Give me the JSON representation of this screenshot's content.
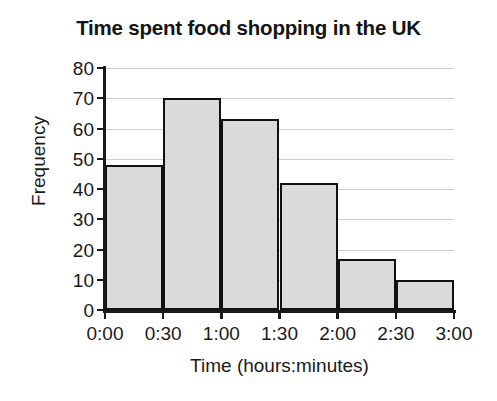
{
  "chart_data": {
    "type": "bar",
    "title": "Time spent food shopping in the UK",
    "xlabel": "Time (hours:minutes)",
    "ylabel": "Frequency",
    "categories": [
      "0:00-0:30",
      "0:30-1:00",
      "1:00-1:30",
      "1:30-2:00",
      "2:00-2:30",
      "2:30-3:00"
    ],
    "values": [
      48,
      70,
      63,
      42,
      17,
      10
    ],
    "bin_edges": [
      "0:00",
      "0:30",
      "1:00",
      "1:30",
      "2:00",
      "2:30",
      "3:00"
    ],
    "xtick_labels": [
      "0:00",
      "0:30",
      "1:00",
      "1:30",
      "2:00",
      "2:30",
      "3:00"
    ],
    "ytick_labels": [
      "0",
      "10",
      "20",
      "30",
      "40",
      "50",
      "60",
      "70",
      "80"
    ],
    "ytick_values": [
      0,
      10,
      20,
      30,
      40,
      50,
      60,
      70,
      80
    ],
    "ylim": [
      0,
      80
    ],
    "xlim": [
      0,
      6
    ],
    "grid": true,
    "grid_axis": "y",
    "legend": false,
    "bar_fill_color": "#dadada",
    "bar_edge_color": "#111111",
    "grid_color": "#cfcfcf",
    "axis_color": "#1a1a1a",
    "background_color": "#ffffff"
  }
}
